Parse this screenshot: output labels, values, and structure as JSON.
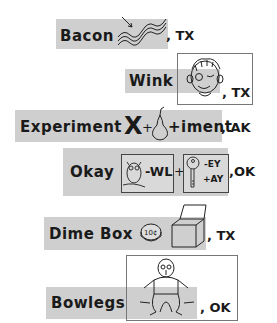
{
  "rebuses": [
    {
      "name": "Bacon",
      "state": "TX",
      "suffix": ", TX",
      "icon": "bacon-strips"
    },
    {
      "name": "Wink",
      "state": "TX",
      "suffix": ", TX",
      "icon": "winking-face"
    },
    {
      "name": "Experiment",
      "state": "AK",
      "suffix": ", AK",
      "parts": [
        "X",
        "+",
        "pear",
        "+iment"
      ]
    },
    {
      "name": "Okay",
      "state": "OK",
      "suffix": ",OK",
      "parts": [
        "owl",
        "-WL",
        "+",
        "key",
        "-EY",
        "+AY"
      ]
    },
    {
      "name": "Dime Box",
      "state": "TX",
      "suffix": ", TX",
      "parts": [
        "dime-coin",
        "box"
      ],
      "coin_label": "10¢"
    },
    {
      "name": "Bowlegs",
      "state": "OK",
      "suffix": ", OK",
      "icon": "bowlegged-man"
    }
  ]
}
